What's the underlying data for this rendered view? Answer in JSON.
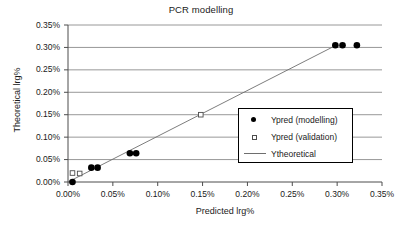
{
  "chart_data": {
    "type": "scatter",
    "title": "PCR modelling",
    "xlabel": "Predicted lrg%",
    "ylabel": "Theoretical lrg%",
    "xlim": [
      0,
      0.35
    ],
    "ylim": [
      0,
      0.35
    ],
    "x_tick_labels": [
      "0.00%",
      "0.05%",
      "0.10%",
      "0.15%",
      "0.20%",
      "0.25%",
      "0.30%",
      "0.35%"
    ],
    "x_tick_values": [
      0,
      0.05,
      0.1,
      0.15,
      0.2,
      0.25,
      0.3,
      0.35
    ],
    "y_tick_labels": [
      "0.00%",
      "0.05%",
      "0.10%",
      "0.15%",
      "0.20%",
      "0.25%",
      "0.30%",
      "0.35%"
    ],
    "y_tick_values": [
      0,
      0.05,
      0.1,
      0.15,
      0.2,
      0.25,
      0.3,
      0.35
    ],
    "grid": {
      "horizontal": true,
      "vertical": false,
      "color": "#8c8c8c"
    },
    "legend_position": "center-right",
    "series": [
      {
        "name": "Ypred (modelling)",
        "marker": "filled-circle",
        "color": "#000000",
        "points": [
          {
            "x": 0.005,
            "y": 0.0
          },
          {
            "x": 0.026,
            "y": 0.032
          },
          {
            "x": 0.033,
            "y": 0.032
          },
          {
            "x": 0.069,
            "y": 0.064
          },
          {
            "x": 0.076,
            "y": 0.064
          },
          {
            "x": 0.298,
            "y": 0.305
          },
          {
            "x": 0.306,
            "y": 0.305
          },
          {
            "x": 0.322,
            "y": 0.305
          }
        ]
      },
      {
        "name": "Ypred (validation)",
        "marker": "open-square",
        "color": "#4d4d4d",
        "points": [
          {
            "x": 0.005,
            "y": 0.02
          },
          {
            "x": 0.013,
            "y": 0.019
          },
          {
            "x": 0.148,
            "y": 0.15
          }
        ]
      },
      {
        "name": "Ytheoretical",
        "marker": "line",
        "color": "#6e6e6e",
        "points": [
          {
            "x": 0.0,
            "y": 0.0
          },
          {
            "x": 0.299,
            "y": 0.305
          }
        ]
      }
    ]
  },
  "legend": {
    "items": [
      {
        "label": "Ypred (modelling)"
      },
      {
        "label": "Ypred (validation)"
      },
      {
        "label": "Ytheoretical"
      }
    ]
  }
}
